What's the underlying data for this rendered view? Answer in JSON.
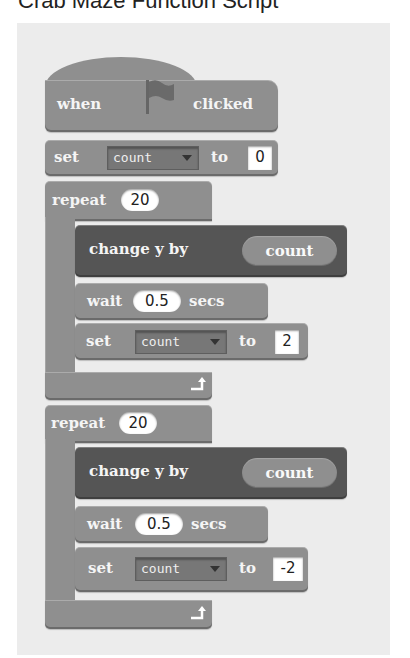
{
  "page": {
    "title": "Crab Maze Function Script"
  },
  "script": {
    "hat": {
      "when": "when",
      "flag_icon": "green-flag-icon",
      "clicked": "clicked"
    },
    "set_init": {
      "keyword": "set",
      "variable": "count",
      "to": "to",
      "value": "0"
    },
    "repeat1": {
      "keyword": "repeat",
      "times": "20",
      "change": {
        "label": "change y by",
        "reporter": "count"
      },
      "wait": {
        "keyword": "wait",
        "value": "0.5",
        "unit": "secs"
      },
      "set": {
        "keyword": "set",
        "variable": "count",
        "to": "to",
        "value": "2"
      }
    },
    "repeat2": {
      "keyword": "repeat",
      "times": "20",
      "change": {
        "label": "change y by",
        "reporter": "count"
      },
      "wait": {
        "keyword": "wait",
        "value": "0.5",
        "unit": "secs"
      },
      "set": {
        "keyword": "set",
        "variable": "count",
        "to": "to",
        "value": "-2"
      }
    }
  },
  "colors": {
    "canvas": "#ececec",
    "block": "#8f8f8f",
    "motion_block": "#555555",
    "input": "#ffffff"
  }
}
